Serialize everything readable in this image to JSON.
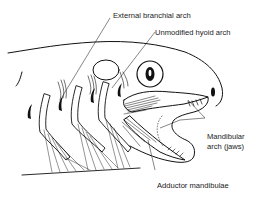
{
  "diagram": {
    "labels": [
      {
        "id": "external-branchial-arch",
        "text": "External branchial arch"
      },
      {
        "id": "unmodified-hyoid-arch",
        "text": "Unmodified hyoid arch"
      },
      {
        "id": "mandibular-arch-line1",
        "text": "Mandibular"
      },
      {
        "id": "mandibular-arch-line2",
        "text": "arch (jaws)"
      },
      {
        "id": "adductor-mandibulae",
        "text": "Adductor mandibulae"
      }
    ],
    "colors": {
      "ink": "#111111",
      "background": "#ffffff"
    }
  }
}
